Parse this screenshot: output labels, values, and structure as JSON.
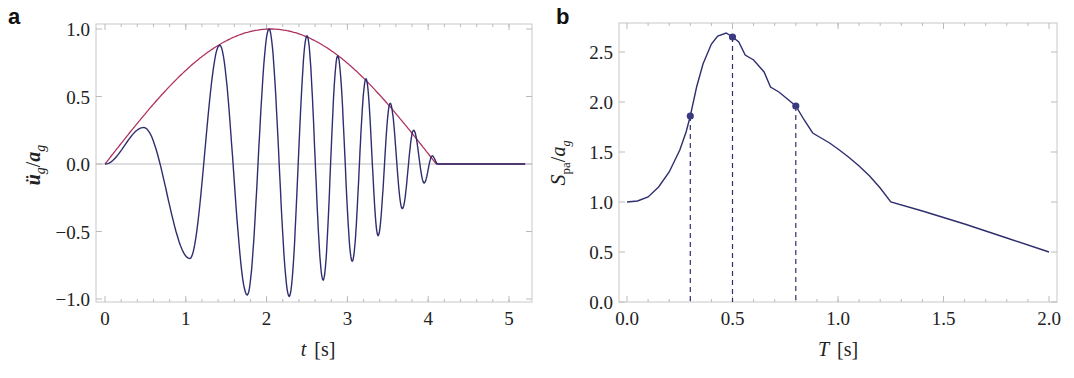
{
  "chart_data": [
    {
      "panel": "a",
      "type": "line",
      "title": "",
      "xlabel": "t [s]",
      "ylabel": "ü_g / a_g",
      "xlim": [
        0,
        5.2
      ],
      "ylim": [
        -1.0,
        1.0
      ],
      "xticks": [
        "0",
        "1",
        "2",
        "3",
        "4",
        "5"
      ],
      "yticks": [
        "1.0",
        "0.5",
        "0.0",
        "-0.5",
        "-1.0"
      ],
      "grid": false,
      "legend": null,
      "series": [
        {
          "name": "envelope",
          "color": "#b03060",
          "description": "half-sine envelope, zero at t=0 and t=4.1, peak 1.0 at t≈2.05",
          "duration": 4.1,
          "t_end": 5.2
        },
        {
          "name": "ground acceleration",
          "color": "#2e2e6e",
          "description": "chirp-like signal under envelope, extrema (time s, value)",
          "extrema": [
            [
              0.0,
              0.0
            ],
            [
              0.48,
              0.27
            ],
            [
              1.05,
              -0.7
            ],
            [
              1.42,
              0.88
            ],
            [
              1.76,
              -0.97
            ],
            [
              2.03,
              1.0
            ],
            [
              2.28,
              -0.98
            ],
            [
              2.5,
              0.95
            ],
            [
              2.7,
              -0.86
            ],
            [
              2.88,
              0.8
            ],
            [
              3.06,
              -0.72
            ],
            [
              3.23,
              0.63
            ],
            [
              3.38,
              -0.53
            ],
            [
              3.53,
              0.45
            ],
            [
              3.68,
              -0.33
            ],
            [
              3.82,
              0.25
            ],
            [
              3.95,
              -0.14
            ],
            [
              4.05,
              0.06
            ],
            [
              4.12,
              0.0
            ],
            [
              5.2,
              0.0
            ]
          ]
        }
      ]
    },
    {
      "panel": "b",
      "type": "line",
      "title": "",
      "xlabel": "T [s]",
      "ylabel": "S_pa / a_g",
      "xlim": [
        0,
        2.0
      ],
      "ylim": [
        0,
        2.75
      ],
      "xticks": [
        "0.0",
        "0.5",
        "1.0",
        "1.5",
        "2.0"
      ],
      "yticks": [
        "2.5",
        "2.0",
        "1.5",
        "1.0",
        "0.5",
        "0.0"
      ],
      "grid": false,
      "legend": null,
      "series": [
        {
          "name": "pseudo-acceleration spectrum",
          "color": "#2e2e6e",
          "x": [
            0.0,
            0.05,
            0.1,
            0.15,
            0.2,
            0.25,
            0.28,
            0.3,
            0.33,
            0.36,
            0.4,
            0.43,
            0.47,
            0.5,
            0.53,
            0.56,
            0.6,
            0.65,
            0.68,
            0.72,
            0.76,
            0.8,
            0.84,
            0.88,
            0.92,
            0.96,
            1.0,
            1.05,
            1.1,
            1.15,
            1.2,
            1.25,
            1.4,
            1.6,
            1.8,
            2.0
          ],
          "y": [
            1.0,
            1.01,
            1.05,
            1.15,
            1.3,
            1.52,
            1.7,
            1.86,
            2.15,
            2.38,
            2.58,
            2.66,
            2.69,
            2.65,
            2.6,
            2.47,
            2.42,
            2.3,
            2.15,
            2.1,
            2.03,
            1.96,
            1.82,
            1.69,
            1.64,
            1.59,
            1.53,
            1.45,
            1.36,
            1.26,
            1.14,
            1.0,
            0.91,
            0.78,
            0.64,
            0.5
          ]
        }
      ],
      "markers": [
        {
          "x": 0.3,
          "y": 1.86
        },
        {
          "x": 0.5,
          "y": 2.65
        },
        {
          "x": 0.8,
          "y": 1.96
        }
      ],
      "annotations": [
        "dashed vertical lines from markers at T = 0.3, 0.5, 0.8 s down to 0"
      ]
    }
  ],
  "labels": {
    "panel_a": "a",
    "panel_b": "b",
    "a_xlabel_var": "t",
    "a_xlabel_unit": "[s]",
    "b_xlabel_var": "T",
    "b_xlabel_unit": "[s]"
  }
}
